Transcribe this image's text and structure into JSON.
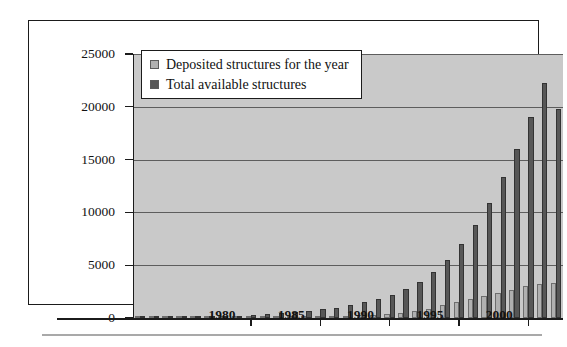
{
  "chart_data": {
    "type": "bar",
    "title": "",
    "subtitle": "",
    "xlabel": "",
    "ylabel": "",
    "grid": true,
    "legend_position": "top-left",
    "xlim": [
      1971.5,
      2002.5
    ],
    "ylim": [
      0,
      25000
    ],
    "y_ticks": [
      0,
      5000,
      10000,
      15000,
      20000,
      25000
    ],
    "y_tick_labels": [
      "0",
      "5000",
      "10000",
      "15000",
      "20000",
      "25000"
    ],
    "x_ticks": [
      1980,
      1985,
      1990,
      1995,
      2000
    ],
    "x_tick_labels": [
      "1980",
      "1985",
      "1990",
      "1995",
      "2000"
    ],
    "categories": [
      1972,
      1973,
      1974,
      1975,
      1976,
      1977,
      1978,
      1979,
      1980,
      1981,
      1982,
      1983,
      1984,
      1985,
      1986,
      1987,
      1988,
      1989,
      1990,
      1991,
      1992,
      1993,
      1994,
      1995,
      1996,
      1997,
      1998,
      1999,
      2000,
      2001,
      2002
    ],
    "series": [
      {
        "name": "Deposited structures for the year",
        "color": "#b0b0b0",
        "values": [
          10,
          15,
          20,
          25,
          30,
          35,
          40,
          50,
          60,
          70,
          80,
          100,
          120,
          150,
          180,
          220,
          280,
          330,
          400,
          500,
          700,
          900,
          1200,
          1500,
          1800,
          2100,
          2400,
          2700,
          3000,
          3200,
          3300
        ]
      },
      {
        "name": "Total available structures",
        "color": "#575757",
        "values": [
          15,
          30,
          50,
          75,
          105,
          140,
          180,
          230,
          290,
          360,
          440,
          540,
          660,
          810,
          990,
          1210,
          1490,
          1820,
          2220,
          2720,
          3420,
          4320,
          5520,
          7020,
          8820,
          10920,
          13320,
          16020,
          19020,
          22220,
          19800
        ]
      }
    ]
  },
  "legend": {
    "entries": [
      {
        "label": "Deposited structures for the year",
        "swatch": "light-gray-swatch"
      },
      {
        "label": "Total available structures",
        "swatch": "dark-gray-swatch"
      }
    ]
  }
}
